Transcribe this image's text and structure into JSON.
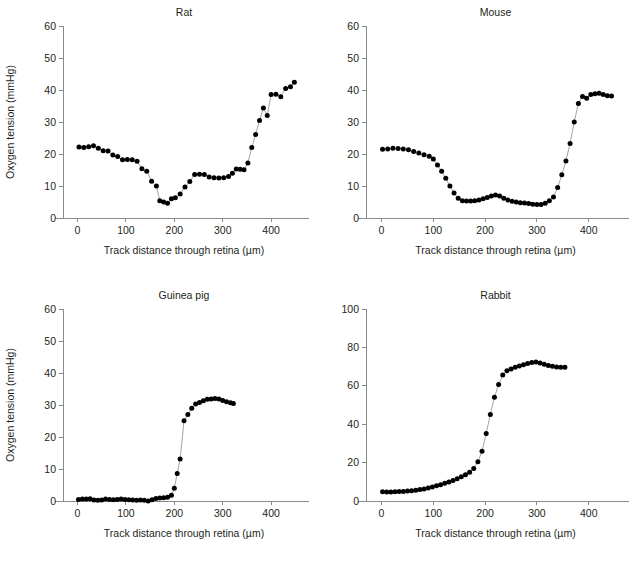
{
  "figure": {
    "background_color": "#ffffff",
    "text_color": "#231f20",
    "axis_color": "#8a8a8a",
    "marker_color": "#000000",
    "line_color": "#9b9b9b",
    "shared_xlabel": "Track distance through retina (µm)",
    "shared_ylabel": "Oxygen tension (mmHg)"
  },
  "chart_data": [
    {
      "type": "scatter",
      "panel": "top-left",
      "title": "Rat",
      "xlabel": "Track distance through retina (µm)",
      "ylabel": "Oxygen tension (mmHg)",
      "show_ylabel": true,
      "xlim": [
        -30,
        470
      ],
      "ylim": [
        0,
        60
      ],
      "xticks": [
        0,
        100,
        200,
        300,
        400
      ],
      "yticks": [
        0,
        10,
        20,
        30,
        40,
        50,
        60
      ],
      "grid": false,
      "legend": false,
      "x": [
        3,
        13,
        23,
        33,
        43,
        53,
        63,
        73,
        83,
        93,
        103,
        113,
        123,
        133,
        143,
        153,
        163,
        170,
        178,
        186,
        194,
        202,
        212,
        222,
        232,
        242,
        252,
        262,
        272,
        282,
        292,
        302,
        312,
        320,
        328,
        336,
        344,
        352,
        360,
        368,
        376,
        384,
        392,
        400,
        410,
        420,
        430,
        440,
        448
      ],
      "y": [
        22.2,
        22.0,
        22.3,
        22.6,
        21.8,
        21.0,
        20.9,
        19.7,
        19.2,
        18.2,
        18.3,
        18.2,
        17.7,
        15.4,
        14.6,
        11.5,
        10.0,
        5.4,
        5.0,
        4.6,
        6.0,
        6.3,
        7.5,
        9.7,
        11.4,
        13.6,
        13.7,
        13.6,
        12.8,
        12.6,
        12.5,
        12.6,
        13.0,
        14.0,
        15.3,
        15.2,
        15.1,
        17.2,
        22.0,
        26.1,
        30.5,
        34.4,
        32.0,
        38.6,
        38.7,
        37.9,
        40.5,
        41.0,
        42.4,
        41.7
      ],
      "ylabel_visible": true
    },
    {
      "type": "scatter",
      "panel": "top-right",
      "title": "Mouse",
      "xlabel": "Track distance through retina (µm)",
      "ylabel": "Oxygen tension (mmHg)",
      "show_ylabel": false,
      "xlim": [
        -30,
        470
      ],
      "ylim": [
        0,
        60
      ],
      "xticks": [
        0,
        100,
        200,
        300,
        400
      ],
      "yticks": [
        0,
        10,
        20,
        30,
        40,
        50,
        60
      ],
      "grid": false,
      "legend": false,
      "x": [
        2,
        12,
        22,
        32,
        42,
        52,
        62,
        72,
        82,
        92,
        100,
        108,
        116,
        124,
        132,
        140,
        148,
        156,
        164,
        172,
        180,
        188,
        196,
        204,
        212,
        220,
        228,
        236,
        244,
        252,
        260,
        268,
        276,
        284,
        292,
        300,
        308,
        316,
        324,
        332,
        340,
        348,
        356,
        364,
        372,
        380,
        388,
        396,
        404,
        412,
        420,
        428,
        436,
        444
      ],
      "y": [
        21.5,
        21.6,
        21.8,
        21.7,
        21.6,
        21.3,
        20.8,
        20.3,
        19.8,
        19.3,
        18.4,
        16.6,
        14.6,
        12.4,
        10.0,
        7.8,
        6.2,
        5.4,
        5.3,
        5.3,
        5.4,
        5.6,
        6.0,
        6.4,
        6.9,
        7.2,
        6.9,
        6.2,
        5.6,
        5.2,
        5.0,
        4.8,
        4.7,
        4.5,
        4.3,
        4.2,
        4.2,
        4.6,
        5.4,
        6.6,
        9.5,
        13.5,
        17.8,
        23.3,
        30.0,
        35.8,
        38.0,
        37.4,
        38.6,
        38.8,
        39.0,
        38.6,
        38.2,
        38.1
      ],
      "ylabel_visible": false
    },
    {
      "type": "scatter",
      "panel": "bottom-left",
      "title": "Guinea pig",
      "xlabel": "Track distance through retina (µm)",
      "ylabel": "Oxygen tension (mmHg)",
      "show_ylabel": true,
      "xlim": [
        -30,
        470
      ],
      "ylim": [
        0,
        60
      ],
      "xticks": [
        0,
        100,
        200,
        300,
        400
      ],
      "yticks": [
        0,
        10,
        20,
        30,
        40,
        50,
        60
      ],
      "grid": false,
      "legend": false,
      "x": [
        2,
        10,
        18,
        26,
        34,
        42,
        50,
        58,
        66,
        74,
        82,
        90,
        98,
        106,
        114,
        122,
        130,
        138,
        146,
        154,
        162,
        170,
        178,
        186,
        194,
        200,
        206,
        212,
        220,
        228,
        236,
        244,
        252,
        260,
        268,
        276,
        284,
        292,
        300,
        308,
        316,
        322
      ],
      "y": [
        0.5,
        0.6,
        0.6,
        0.7,
        0.3,
        0.2,
        0.3,
        0.6,
        0.5,
        0.4,
        0.5,
        0.6,
        0.5,
        0.4,
        0.3,
        0.2,
        0.3,
        0.2,
        0.0,
        0.4,
        0.8,
        0.9,
        1.0,
        1.2,
        1.8,
        4.0,
        8.6,
        13.1,
        25.1,
        27.0,
        29.0,
        30.3,
        30.8,
        31.3,
        31.8,
        31.9,
        32.0,
        31.9,
        31.4,
        31.0,
        30.7,
        30.5
      ],
      "ylabel_visible": true
    },
    {
      "type": "scatter",
      "panel": "bottom-right",
      "title": "Rabbit",
      "xlabel": "Track distance through retina (µm)",
      "ylabel": "Oxygen tension (mmHg)",
      "show_ylabel": false,
      "xlim": [
        -30,
        470
      ],
      "ylim": [
        0,
        100
      ],
      "xticks": [
        0,
        100,
        200,
        300,
        400
      ],
      "yticks": [
        0,
        20,
        40,
        60,
        80,
        100
      ],
      "grid": false,
      "legend": false,
      "x": [
        2,
        10,
        18,
        26,
        34,
        42,
        50,
        58,
        66,
        74,
        82,
        90,
        98,
        106,
        114,
        122,
        130,
        138,
        146,
        154,
        162,
        170,
        178,
        186,
        194,
        202,
        210,
        218,
        226,
        234,
        242,
        250,
        258,
        266,
        274,
        282,
        290,
        298,
        306,
        314,
        322,
        330,
        338,
        346,
        354
      ],
      "y": [
        4.8,
        4.7,
        4.7,
        4.8,
        4.9,
        5.0,
        5.2,
        5.4,
        5.6,
        6.0,
        6.3,
        6.8,
        7.3,
        7.9,
        8.5,
        9.2,
        9.9,
        10.7,
        11.6,
        12.6,
        13.7,
        15.0,
        16.9,
        20.4,
        25.9,
        35.1,
        45.1,
        54.0,
        60.7,
        65.6,
        67.8,
        68.8,
        69.6,
        70.3,
        71.0,
        71.6,
        72.1,
        72.4,
        71.9,
        71.2,
        70.6,
        70.2,
        69.8,
        69.6,
        69.6
      ],
      "ylabel_visible": false
    }
  ]
}
